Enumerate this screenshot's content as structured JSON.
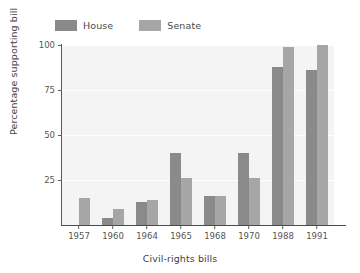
{
  "chart_data": {
    "type": "bar",
    "title": "",
    "xlabel": "Civil-rights bills",
    "ylabel": "Percentage supporting bill",
    "categories": [
      "1957",
      "1960",
      "1964",
      "1965",
      "1968",
      "1970",
      "1988",
      "1991"
    ],
    "series": [
      {
        "name": "House",
        "color": "#8a8a8a",
        "values": [
          0,
          4,
          13,
          40,
          16,
          40,
          88,
          86
        ]
      },
      {
        "name": "Senate",
        "color": "#a6a6a6",
        "values": [
          15,
          9,
          14,
          26,
          16,
          26,
          99,
          100
        ]
      }
    ],
    "ylim": [
      0,
      100
    ],
    "yticks": [
      "0",
      "25",
      "50",
      "75",
      "100"
    ],
    "ytick_values": [
      0,
      25,
      50,
      75,
      100
    ],
    "grid": "horizontal-white-on-light-background",
    "legend_position": "top-left-above-plot",
    "plot_background": "#f4f4f4",
    "figure_background": "#ffffff",
    "axis_color": "#5a5a5a"
  },
  "legend": {
    "items": [
      {
        "label": "House",
        "color": "#8a8a8a"
      },
      {
        "label": "Senate",
        "color": "#a6a6a6"
      }
    ]
  },
  "axes": {
    "y_title": "Percentage supporting bill",
    "x_title": "Civil-rights bills",
    "y_tick_labels": [
      "100",
      "75",
      "50",
      "25"
    ],
    "x_tick_labels": [
      "1957",
      "1960",
      "1964",
      "1965",
      "1968",
      "1970",
      "1988",
      "1991"
    ]
  }
}
